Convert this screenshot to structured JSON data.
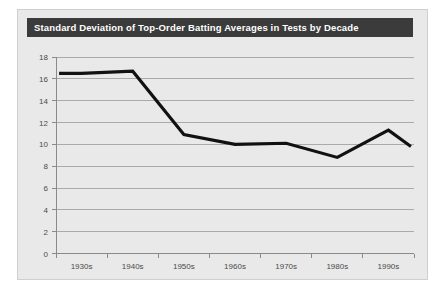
{
  "chart_data": {
    "type": "line",
    "title": "Standard Deviation of Top-Order Batting Averages in Tests by Decade",
    "xlabel": "",
    "ylabel": "",
    "categories": [
      "1930s",
      "1940s",
      "1950s",
      "1960s",
      "1970s",
      "1980s",
      "1990s"
    ],
    "values": [
      16.5,
      16.7,
      10.9,
      10.0,
      10.1,
      8.8,
      11.3
    ],
    "series": [
      {
        "name": "Standard Deviation",
        "values": [
          16.5,
          16.7,
          10.9,
          10.0,
          10.1,
          8.8,
          11.3
        ]
      }
    ],
    "end_value": 9.8,
    "ylim": [
      0,
      18
    ],
    "y_ticks": [
      0,
      2,
      4,
      6,
      8,
      10,
      12,
      14,
      16,
      18
    ],
    "y_tick_labels": [
      "0",
      "2",
      "4",
      "6",
      "8",
      "10",
      "12",
      "14",
      "16",
      "18"
    ],
    "x_tick_labels": [
      "1930s",
      "1940s",
      "1950s",
      "1960s",
      "1970s",
      "1980s",
      "1990s"
    ],
    "grid": true,
    "legend": false,
    "legend_position": "none",
    "line_color": "#111111",
    "grid_color": "#9a9a9a",
    "panel_color": "#e9e9e9",
    "title_bar_color": "#3b3b3b",
    "title_text_color": "#ffffff"
  }
}
